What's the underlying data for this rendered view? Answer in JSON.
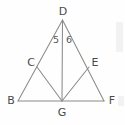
{
  "figure": {
    "kind": "geometry-diagram",
    "canvas": {
      "width": 125,
      "height": 125
    },
    "background_color": "#fefefe",
    "line_color": "#8a8a8a",
    "label_color": "#4a4a4a",
    "angle_label_color": "#555555",
    "points": [
      {
        "id": "D",
        "label": "D",
        "x": 62.5,
        "y": 20.0,
        "label_x": 63.0,
        "label_y": 11.0
      },
      {
        "id": "C",
        "label": "C",
        "x": 37.0,
        "y": 67.0,
        "label_x": 31.0,
        "label_y": 62.0
      },
      {
        "id": "E",
        "label": "E",
        "x": 89.0,
        "y": 67.0,
        "label_x": 95.0,
        "label_y": 62.0
      },
      {
        "id": "B",
        "label": "B",
        "x": 18.0,
        "y": 101.0,
        "label_x": 11.0,
        "label_y": 100.0
      },
      {
        "id": "G",
        "label": "G",
        "x": 62.0,
        "y": 101.0,
        "label_x": 62.0,
        "label_y": 112.0
      },
      {
        "id": "F",
        "label": "F",
        "x": 104.0,
        "y": 101.0,
        "label_x": 112.0,
        "label_y": 100.0
      }
    ],
    "segments": [
      {
        "id": "BD",
        "from": "B",
        "to": "D",
        "name": "segment-bd"
      },
      {
        "id": "DF",
        "from": "D",
        "to": "F",
        "name": "segment-df"
      },
      {
        "id": "BF",
        "from": "B",
        "to": "F",
        "name": "segment-bf"
      },
      {
        "id": "DG",
        "from": "D",
        "to": "G",
        "name": "segment-dg"
      },
      {
        "id": "CG",
        "from": "C",
        "to": "G",
        "name": "segment-cg"
      },
      {
        "id": "EG",
        "from": "E",
        "to": "G",
        "name": "segment-eg"
      }
    ],
    "angle_labels": [
      {
        "id": "5",
        "text": "5",
        "x": 56.0,
        "y": 40.0,
        "at_vertex": "D",
        "side": "left"
      },
      {
        "id": "6",
        "text": "6",
        "x": 69.0,
        "y": 40.0,
        "at_vertex": "D",
        "side": "right"
      }
    ]
  }
}
